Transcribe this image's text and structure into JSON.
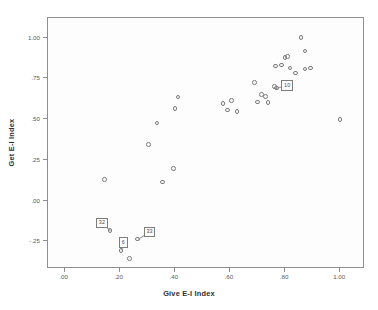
{
  "chart_data": {
    "type": "scatter",
    "title": "",
    "xlabel": "Give E-I Index",
    "ylabel": "Get E-I Index",
    "xlim": [
      -0.06,
      1.09
    ],
    "ylim": [
      -0.42,
      1.12
    ],
    "grid": false,
    "legend": "none",
    "xticks": [
      {
        "value": 0.0,
        "label": ".00"
      },
      {
        "value": 0.2,
        "label": ".20"
      },
      {
        "value": 0.4,
        "label": ".40"
      },
      {
        "value": 0.6,
        "label": ".60"
      },
      {
        "value": 0.8,
        "label": ".80"
      },
      {
        "value": 1.0,
        "label": "1.00"
      }
    ],
    "yticks": [
      {
        "value": 1.0,
        "label": "1.00"
      },
      {
        "value": 0.75,
        "label": ".75"
      },
      {
        "value": 0.5,
        "label": ".50"
      },
      {
        "value": 0.25,
        "label": ".25"
      },
      {
        "value": 0.0,
        "label": ".00"
      },
      {
        "value": -0.25,
        "label": "-.25"
      }
    ],
    "marker": {
      "shape": "open-circle",
      "color": "#7a7a7a",
      "size_px": 4.6
    },
    "points": [
      {
        "x": 0.145,
        "y": 0.13
      },
      {
        "x": 0.165,
        "y": -0.185,
        "label": "32"
      },
      {
        "x": 0.205,
        "y": -0.305,
        "label": "6"
      },
      {
        "x": 0.235,
        "y": -0.355
      },
      {
        "x": 0.265,
        "y": -0.235,
        "label": "33"
      },
      {
        "x": 0.305,
        "y": 0.345
      },
      {
        "x": 0.335,
        "y": 0.475
      },
      {
        "x": 0.355,
        "y": 0.115
      },
      {
        "x": 0.395,
        "y": 0.195
      },
      {
        "x": 0.4,
        "y": 0.565
      },
      {
        "x": 0.412,
        "y": 0.635
      },
      {
        "x": 0.575,
        "y": 0.595
      },
      {
        "x": 0.592,
        "y": 0.555
      },
      {
        "x": 0.605,
        "y": 0.615
      },
      {
        "x": 0.625,
        "y": 0.545
      },
      {
        "x": 0.69,
        "y": 0.725
      },
      {
        "x": 0.7,
        "y": 0.605
      },
      {
        "x": 0.715,
        "y": 0.65
      },
      {
        "x": 0.73,
        "y": 0.64
      },
      {
        "x": 0.738,
        "y": 0.602
      },
      {
        "x": 0.762,
        "y": 0.7
      },
      {
        "x": 0.765,
        "y": 0.825
      },
      {
        "x": 0.768,
        "y": 0.69,
        "label": "10"
      },
      {
        "x": 0.788,
        "y": 0.832
      },
      {
        "x": 0.8,
        "y": 0.878
      },
      {
        "x": 0.808,
        "y": 0.885
      },
      {
        "x": 0.818,
        "y": 0.812
      },
      {
        "x": 0.838,
        "y": 0.782
      },
      {
        "x": 0.858,
        "y": 1.0
      },
      {
        "x": 0.872,
        "y": 0.918
      },
      {
        "x": 0.872,
        "y": 0.808
      },
      {
        "x": 0.892,
        "y": 0.812
      },
      {
        "x": 1.0,
        "y": 0.498
      }
    ]
  }
}
